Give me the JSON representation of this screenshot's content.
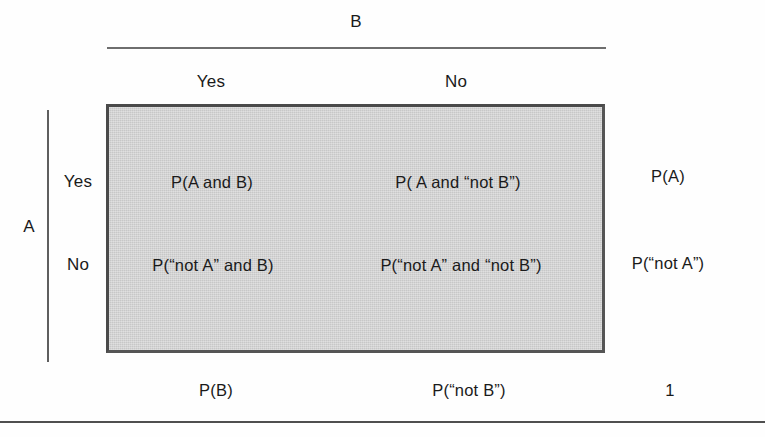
{
  "figure": {
    "row_variable_label": "A",
    "column_variable_label": "B",
    "column_headers": [
      "Yes",
      "No"
    ],
    "row_headers": [
      "Yes",
      "No"
    ],
    "cells": [
      [
        "P(A and B)",
        "P( A and “not B”)"
      ],
      [
        "P(“not A” and B)",
        "P(“not A” and “not B”)"
      ]
    ],
    "row_margins": [
      "P(A)",
      "P(“not A”)"
    ],
    "column_margins": [
      "P(B)",
      "P(“not B”)"
    ],
    "grand_total": "1",
    "colors": {
      "shaded_fill": "#cdcdcd",
      "box_border": "#4a4a4a",
      "rule": "#5f5f5f",
      "text": "#1a1a1a",
      "page_background": "#ffffff"
    }
  }
}
